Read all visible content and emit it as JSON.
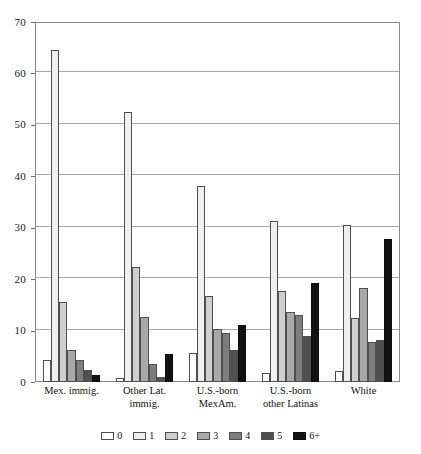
{
  "chart_data": {
    "type": "bar",
    "title": "",
    "subtitle": "",
    "xlabel": "",
    "ylabel": "",
    "ylim": [
      0,
      70
    ],
    "yticks": [
      0,
      10,
      20,
      30,
      40,
      50,
      60,
      70
    ],
    "ytick_labels": [
      "0",
      "10",
      "20",
      "30",
      "40",
      "50",
      "60",
      "70"
    ],
    "grid": true,
    "legend_position": "bottom",
    "legend_title": "",
    "categories": [
      "Mex. immig.",
      "Other Lat. immig.",
      "U.S.-born MexAm.",
      "U.S.-born other Latinas",
      "White"
    ],
    "category_lines": [
      [
        "Mex. immig."
      ],
      [
        "Other Lat.",
        "immig."
      ],
      [
        "U.S.-born",
        "MexAm."
      ],
      [
        "U.S.-born",
        "other Latinas"
      ],
      [
        "White"
      ]
    ],
    "series": [
      {
        "name": "0",
        "color": "#ffffff",
        "values": [
          4.3,
          0.7,
          5.6,
          1.8,
          2.2
        ]
      },
      {
        "name": "1",
        "color": "#efefef",
        "values": [
          64.5,
          52.5,
          38.2,
          31.3,
          30.6
        ]
      },
      {
        "name": "2",
        "color": "#cfcfcf",
        "values": [
          15.5,
          22.3,
          16.8,
          17.7,
          12.5
        ]
      },
      {
        "name": "3",
        "color": "#a8a8a8",
        "values": [
          6.3,
          12.6,
          10.4,
          13.6,
          18.2
        ]
      },
      {
        "name": "4",
        "color": "#7d7d7d",
        "values": [
          4.2,
          3.5,
          9.6,
          13.0,
          7.7
        ]
      },
      {
        "name": "5",
        "color": "#4f4f4f",
        "values": [
          2.3,
          0.9,
          6.3,
          8.9,
          8.2
        ]
      },
      {
        "name": "6+",
        "color": "#121212",
        "values": [
          1.3,
          5.4,
          11.0,
          19.2,
          27.8
        ]
      }
    ]
  }
}
